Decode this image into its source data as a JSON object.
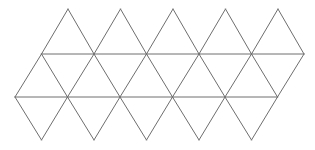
{
  "diagram": {
    "type": "icosahedron-net",
    "face_count": 20,
    "stroke_color": "#6e6e6e",
    "background": "#ffffff",
    "rows": {
      "top_apex_y": 9,
      "upper_line_y": 54,
      "lower_line_y": 97,
      "bottom_apex_y": 140
    },
    "top_apex_x": [
      68,
      120.5,
      173,
      225.5,
      278
    ],
    "upper_line_x": [
      41.5,
      94,
      146.5,
      199,
      251.5,
      304
    ],
    "lower_line_x": [
      15,
      67.5,
      120,
      172.5,
      225,
      277.5
    ],
    "bottom_apex_x": [
      41.5,
      94,
      146.5,
      199,
      251.5
    ]
  }
}
